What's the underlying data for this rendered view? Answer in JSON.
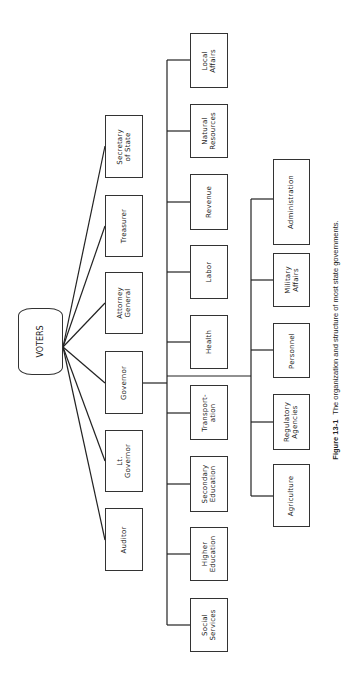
{
  "diagram": {
    "root": {
      "label": "VOTERS"
    },
    "elected_officials": [
      {
        "label": "Secretary\nof State"
      },
      {
        "label": "Treasurer"
      },
      {
        "label": "Attorney\nGeneral"
      },
      {
        "label": "Governor"
      },
      {
        "label": "Lt.\nGovernor"
      },
      {
        "label": "Auditor"
      }
    ],
    "departments": [
      {
        "label": "Local\nAffairs"
      },
      {
        "label": "Natural\nResources"
      },
      {
        "label": "Revenue"
      },
      {
        "label": "Labor"
      },
      {
        "label": "Health"
      },
      {
        "label": "Transport-\nation"
      },
      {
        "label": "Secondary\nEducation"
      },
      {
        "label": "Higher\nEducation"
      },
      {
        "label": "Social\nServices"
      }
    ],
    "staff_agencies": [
      {
        "label": "Administration"
      },
      {
        "label": "Military\nAffairs"
      },
      {
        "label": "Personnel"
      },
      {
        "label": "Regulatory\nAgencies"
      },
      {
        "label": "Agriculture"
      }
    ]
  },
  "caption": {
    "figure_number": "Figure 13-1",
    "text": "The organization and structure of most state governments."
  }
}
